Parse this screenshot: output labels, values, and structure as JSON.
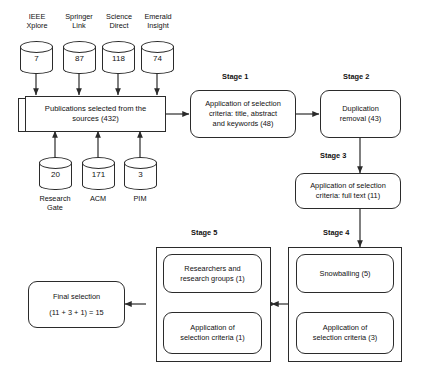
{
  "figure": {
    "stroke_color": "#2b2b2b",
    "text_color": "#111111",
    "background": "#ffffff"
  },
  "sources_top": [
    {
      "name": "ieee-xplore",
      "label_lines": [
        "IEEE",
        "Xplore"
      ],
      "count": "7"
    },
    {
      "name": "springer-link",
      "label_lines": [
        "Springer",
        "Link"
      ],
      "count": "87"
    },
    {
      "name": "science-direct",
      "label_lines": [
        "Science",
        "Direct"
      ],
      "count": "118"
    },
    {
      "name": "emerald-insight",
      "label_lines": [
        "Emerald",
        "Insight"
      ],
      "count": "74"
    }
  ],
  "sources_bottom": [
    {
      "name": "research-gate",
      "label_lines": [
        "Research",
        "Gate"
      ],
      "count": "20"
    },
    {
      "name": "acm",
      "label_lines": [
        "ACM"
      ],
      "count": "171"
    },
    {
      "name": "pim",
      "label_lines": [
        "PIM"
      ],
      "count": "3"
    }
  ],
  "publications": {
    "lines": [
      "Publications selected from the",
      "sources (432)"
    ],
    "total": "432"
  },
  "stages": {
    "stage1": {
      "label": "Stage 1",
      "lines": [
        "Application of selection",
        "criteria: title, abstract",
        "and keywords (48)"
      ],
      "count": "48"
    },
    "stage2": {
      "label": "Stage 2",
      "lines": [
        "Duplication",
        "removal (43)"
      ],
      "count": "43"
    },
    "stage3": {
      "label": "Stage 3",
      "lines": [
        "Application of selection",
        "criteria: full text (11)"
      ],
      "count": "11"
    },
    "stage4": {
      "label": "Stage 4",
      "box_a": {
        "lines": [
          "Snowballing (5)"
        ],
        "count": "5"
      },
      "box_b": {
        "lines": [
          "Application of",
          "selection criteria (3)"
        ],
        "count": "3"
      }
    },
    "stage5": {
      "label": "Stage 5",
      "box_a": {
        "lines": [
          "Researchers and",
          "research groups (1)"
        ],
        "count": "1"
      },
      "box_b": {
        "lines": [
          "Application of",
          "selection criteria (1)"
        ],
        "count": "1"
      }
    }
  },
  "final": {
    "lines": [
      "Final selection",
      "(11 + 3 + 1) = 15"
    ],
    "total": "15"
  }
}
